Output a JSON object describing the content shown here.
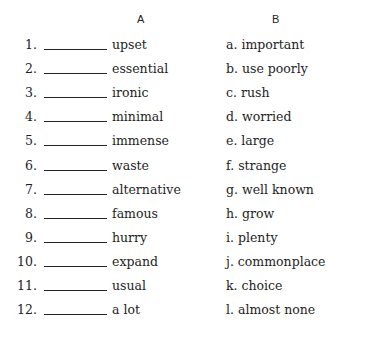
{
  "columns": {
    "a_header": "A",
    "b_header": "B"
  },
  "column_a": [
    {
      "num": "1.",
      "word": "upset"
    },
    {
      "num": "2.",
      "word": "essential"
    },
    {
      "num": "3.",
      "word": "ironic"
    },
    {
      "num": "4.",
      "word": "minimal"
    },
    {
      "num": "5.",
      "word": "immense"
    },
    {
      "num": "6.",
      "word": "waste"
    },
    {
      "num": "7.",
      "word": "alternative"
    },
    {
      "num": "8.",
      "word": "famous"
    },
    {
      "num": "9.",
      "word": "hurry"
    },
    {
      "num": "10.",
      "word": "expand"
    },
    {
      "num": "11.",
      "word": "usual"
    },
    {
      "num": "12.",
      "word": "a lot"
    }
  ],
  "column_b": [
    {
      "text": "a.  important"
    },
    {
      "text": "b.  use poorly"
    },
    {
      "text": "c.  rush"
    },
    {
      "text": "d.  worried"
    },
    {
      "text": "e.  large"
    },
    {
      "text": "f.  strange"
    },
    {
      "text": "g.  well known"
    },
    {
      "text": "h.  grow"
    },
    {
      "text": "i.  plenty"
    },
    {
      "text": "j.  commonplace"
    },
    {
      "text": "k.  choice"
    },
    {
      "text": "l.  almost none"
    }
  ]
}
